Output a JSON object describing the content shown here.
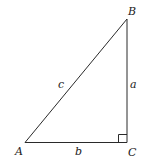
{
  "diagram": {
    "vertices": {
      "A": {
        "label": "A",
        "x": 25,
        "y": 142.5
      },
      "B": {
        "label": "B",
        "x": 127,
        "y": 19
      },
      "C": {
        "label": "C",
        "x": 127,
        "y": 142.5
      }
    },
    "sides": {
      "a": {
        "label": "a",
        "from": "B",
        "to": "C"
      },
      "b": {
        "label": "b",
        "from": "A",
        "to": "C"
      },
      "c": {
        "label": "c",
        "from": "A",
        "to": "B"
      }
    },
    "right_angle_at": "C",
    "colors": {
      "stroke": "#2a2a2a",
      "text": "#222222",
      "background": "#ffffff"
    }
  }
}
